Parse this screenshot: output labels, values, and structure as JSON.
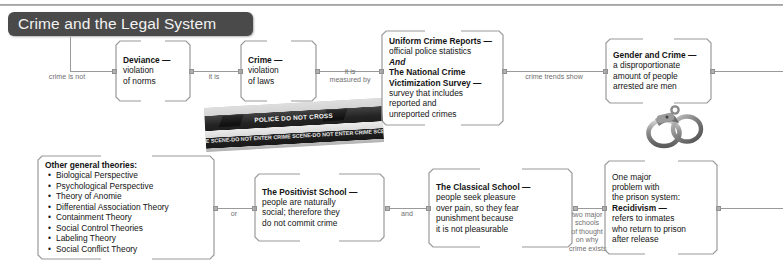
{
  "document": {
    "title": "Crime and the Legal System"
  },
  "nodes": {
    "deviance": {
      "head": "Deviance —",
      "line2": "violation",
      "line3": "of norms"
    },
    "crime": {
      "head": "Crime —",
      "line2": "violation",
      "line3": "of laws"
    },
    "ucr": {
      "head": "Uniform Crime Reports —",
      "line2": "official police statistics",
      "conj": "And",
      "head2a": "The National Crime",
      "head2b": "Victimization Survey —",
      "line3": "survey that includes",
      "line4": "reported and",
      "line5": "unreported crimes"
    },
    "gender": {
      "head": "Gender and Crime —",
      "line2": "a disproportionate",
      "line3": "amount of people",
      "line4": "arrested are men"
    },
    "other_theories": {
      "head": "Other general theories:",
      "items": [
        "Biological Perspective",
        "Psychological Perspective",
        "Theory of Anomie",
        "Differential Association Theory",
        "Containment Theory",
        "Social Control Theories",
        "Labeling Theory",
        "Social Conflict Theory"
      ]
    },
    "positivist": {
      "head": "The Positivist School —",
      "line2": "people are naturally",
      "line3": "social; therefore they",
      "line4": "do not commit crime"
    },
    "classical": {
      "head": "The Classical School —",
      "line2": "people seek pleasure",
      "line3": "over pain, so they fear",
      "line4": "punishment because",
      "line5": "it is not pleasurable"
    },
    "recidivism": {
      "line1": "One major",
      "line2": "problem with",
      "line3": "the prison system:",
      "head": "Recidivism —",
      "line4": "refers to inmates",
      "line5": "who return to prison",
      "line6": "after release"
    }
  },
  "wire_labels": {
    "crime_is_not": "crime is not",
    "it_is": "it is",
    "it_is_measured_by": "it is\nmeasured by",
    "crime_trends_show": "crime trends show",
    "or": "or",
    "and": "and",
    "two_major_schools": "two major\nschools\nof thought\non why\ncrime exists"
  },
  "images": {
    "police_tape": {
      "name": "police-crime-scene-tape-photo",
      "band_top": "POLICE DO NOT CROSS",
      "band_bottom": "E SCENE-DO NOT ENTER  CRIME SCENE-DO NOT ENTER  CRIME SCEN"
    },
    "handcuffs": {
      "name": "handcuffs-photo"
    }
  },
  "colors": {
    "title_pill": "#4a4a4a",
    "title_text": "#f2f2f2",
    "bracket": "#9a9a9a",
    "wire": "#9a9a9a",
    "wire_label_text": "#6f6f6f",
    "body_text": "#141414",
    "page_background": "#ffffff"
  }
}
